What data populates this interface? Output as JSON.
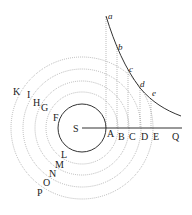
{
  "diagram": {
    "center_label": "S",
    "axis_labels": [
      "A",
      "B",
      "C",
      "D",
      "E",
      "Q"
    ],
    "curve_labels": [
      "a",
      "b",
      "c",
      "d",
      "e"
    ],
    "upper_left_labels": [
      "K",
      "I",
      "H",
      "G",
      "F"
    ],
    "lower_left_labels": [
      "L",
      "M",
      "N",
      "O",
      "P"
    ]
  }
}
